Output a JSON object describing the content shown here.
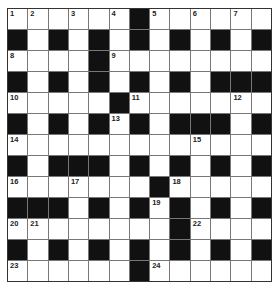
{
  "puzzle": {
    "type": "crossword",
    "rows": 13,
    "cols": 13,
    "grid": [
      "WWWWWWBWWWWWW",
      "BWBWBWBWBWBWB",
      "WWWWBWWWWWWWW",
      "BWBWBWBWBWBBB",
      "WWWWWBWWWWWWW",
      "BWBWBWBWBBBWB",
      "WWWWWWWWWWWWW",
      "BWBBBWBWBWBWB",
      "WWWWWWWBWWWWW",
      "BBBWBWBWBWBWB",
      "WWWWWWWWBWWWW",
      "BWBWBWBWBWBWB",
      "WWWWWWBWWWWWW"
    ],
    "numbers": [
      {
        "n": "1",
        "r": 0,
        "c": 0
      },
      {
        "n": "2",
        "r": 0,
        "c": 1
      },
      {
        "n": "3",
        "r": 0,
        "c": 3
      },
      {
        "n": "4",
        "r": 0,
        "c": 5
      },
      {
        "n": "5",
        "r": 0,
        "c": 7
      },
      {
        "n": "6",
        "r": 0,
        "c": 9
      },
      {
        "n": "7",
        "r": 0,
        "c": 11
      },
      {
        "n": "8",
        "r": 2,
        "c": 0
      },
      {
        "n": "9",
        "r": 2,
        "c": 5
      },
      {
        "n": "10",
        "r": 4,
        "c": 0
      },
      {
        "n": "11",
        "r": 4,
        "c": 6
      },
      {
        "n": "12",
        "r": 4,
        "c": 11
      },
      {
        "n": "13",
        "r": 5,
        "c": 5
      },
      {
        "n": "14",
        "r": 6,
        "c": 0
      },
      {
        "n": "15",
        "r": 6,
        "c": 9
      },
      {
        "n": "16",
        "r": 8,
        "c": 0
      },
      {
        "n": "17",
        "r": 8,
        "c": 3
      },
      {
        "n": "18",
        "r": 8,
        "c": 8
      },
      {
        "n": "19",
        "r": 9,
        "c": 7
      },
      {
        "n": "20",
        "r": 10,
        "c": 0
      },
      {
        "n": "21",
        "r": 10,
        "c": 1
      },
      {
        "n": "22",
        "r": 10,
        "c": 9
      },
      {
        "n": "23",
        "r": 12,
        "c": 0
      },
      {
        "n": "24",
        "r": 12,
        "c": 7
      }
    ]
  }
}
